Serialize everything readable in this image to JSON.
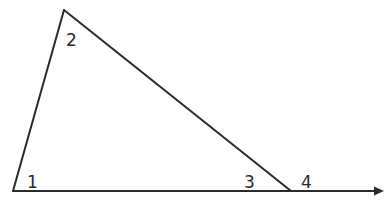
{
  "diagram": {
    "type": "geometry-triangle-exterior-angle",
    "stroke_color": "#2a2a2a",
    "background_color": "#ffffff",
    "vertices": {
      "top": {
        "x": 64,
        "y": 10
      },
      "bottom_left": {
        "x": 13,
        "y": 191
      },
      "bottom_right": {
        "x": 291,
        "y": 191
      }
    },
    "extended_ray": {
      "from": {
        "x": 13,
        "y": 191
      },
      "to": {
        "x": 383,
        "y": 191
      },
      "arrow": true
    },
    "angle_labels": [
      {
        "id": "1",
        "text": "1",
        "x": 27,
        "y": 188,
        "position": "interior angle at bottom-left vertex"
      },
      {
        "id": "2",
        "text": "2",
        "x": 66,
        "y": 46,
        "position": "interior angle at top vertex"
      },
      {
        "id": "3",
        "text": "3",
        "x": 244,
        "y": 188,
        "position": "interior angle at bottom-right vertex"
      },
      {
        "id": "4",
        "text": "4",
        "x": 301,
        "y": 188,
        "position": "exterior angle at bottom-right vertex"
      }
    ]
  }
}
